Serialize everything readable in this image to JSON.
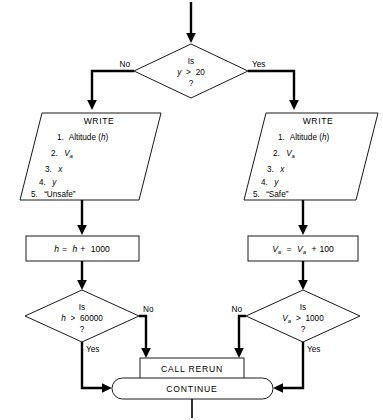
{
  "diagram": {
    "type": "flowchart",
    "background_color": "#ffffff",
    "line_color": "#000000",
    "shape_fill": "#ffffff",
    "shape_stroke": "#1a1a1a"
  },
  "decision_top": {
    "line1": "Is",
    "var": "y",
    "op": ">",
    "value": "20",
    "line3": "?",
    "branch_no": "No",
    "branch_yes": "Yes"
  },
  "write_left": {
    "header": "WRITE",
    "items": [
      {
        "num": "1.",
        "text": "Altitude (h)"
      },
      {
        "num": "2.",
        "text": "Va"
      },
      {
        "num": "3.",
        "text": "x"
      },
      {
        "num": "4.",
        "text": "y"
      },
      {
        "num": "5.",
        "text": "“Unsafe”"
      }
    ]
  },
  "write_right": {
    "header": "WRITE",
    "items": [
      {
        "num": "1.",
        "text": "Altitude (h)"
      },
      {
        "num": "2.",
        "text": "Va"
      },
      {
        "num": "3.",
        "text": "x"
      },
      {
        "num": "4.",
        "text": "y"
      },
      {
        "num": "5.",
        "text": "“Safe”"
      }
    ]
  },
  "process_left": {
    "text": "h = h + 1000"
  },
  "process_right": {
    "text": "Va = Va + 100"
  },
  "decision_left": {
    "line1": "Is",
    "var": "h",
    "op": ">",
    "value": "60000",
    "line3": "?",
    "branch_no": "No",
    "branch_yes": "Yes"
  },
  "decision_right": {
    "line1": "Is",
    "var": "Va",
    "op": ">",
    "value": "1000",
    "line3": "?",
    "branch_no": "No",
    "branch_yes": "Yes"
  },
  "call_box": {
    "text": "CALL RERUN"
  },
  "terminator": {
    "text": "CONTINUE"
  }
}
